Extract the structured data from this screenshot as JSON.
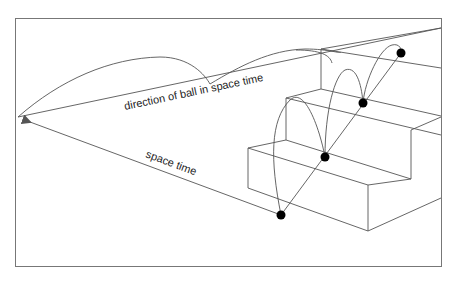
{
  "diagram": {
    "labels": {
      "direction": "direction of ball in space time",
      "space_time": "space time"
    },
    "colors": {
      "line": "#555555",
      "ball": "#000000",
      "frame": "#777777",
      "background": "#ffffff"
    },
    "elements": {
      "staircase_steps": 3,
      "ball_positions": 4
    }
  }
}
